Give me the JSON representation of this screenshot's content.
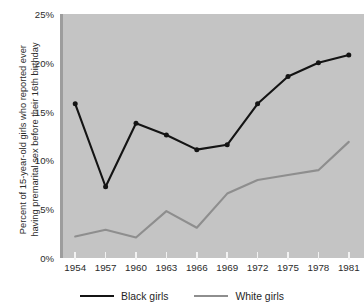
{
  "chart_data": {
    "type": "line",
    "title": "",
    "xlabel": "",
    "ylabel_line1": "Percent of 15-year-old girls who reported ever",
    "ylabel_line2": "having premarital sex before their 16th birthday",
    "x": [
      1954,
      1957,
      1960,
      1963,
      1966,
      1969,
      1972,
      1975,
      1978,
      1981
    ],
    "xticklabels": [
      "1954",
      "1957",
      "1960",
      "1963",
      "1966",
      "1969",
      "1972",
      "1975",
      "1978",
      "1981"
    ],
    "yticklabels": [
      "0%",
      "5%",
      "10%",
      "15%",
      "20%",
      "25%"
    ],
    "ytickvalues": [
      0,
      5,
      10,
      15,
      20,
      25
    ],
    "ylim": [
      0,
      25
    ],
    "xlim": [
      1952.5,
      1982.5
    ],
    "grid": false,
    "legend_position": "below",
    "plot_background": "#c4c4c4",
    "figure_background": "#ffffff",
    "series": [
      {
        "name": "Black girls",
        "color": "#141414",
        "marker": "circle",
        "values": [
          15.8,
          7.3,
          13.8,
          12.6,
          11.1,
          11.6,
          15.8,
          18.6,
          20.0,
          20.8
        ]
      },
      {
        "name": "White girls",
        "color": "#8e8e8e",
        "marker": "none",
        "values": [
          2.2,
          2.9,
          2.1,
          4.8,
          3.1,
          6.6,
          8.0,
          8.5,
          9.0,
          11.9
        ]
      }
    ]
  },
  "legend": {
    "items": [
      {
        "label": "Black girls",
        "color": "#141414"
      },
      {
        "label": "White girls",
        "color": "#8e8e8e"
      }
    ]
  }
}
